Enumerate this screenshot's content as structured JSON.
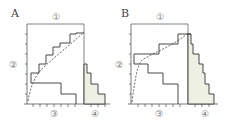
{
  "panels": [
    {
      "label": "A",
      "markers": {
        "top": "①",
        "left": "②",
        "bottom_left": "③",
        "bottom_right": "④"
      }
    },
    {
      "label": "B",
      "markers": {
        "top": "①",
        "left": "②",
        "bottom_left": "③",
        "bottom_right": "④"
      }
    }
  ],
  "colors": {
    "line": "#333333",
    "axis": "#555555",
    "shade": "#eef0e4",
    "dash": "#444444"
  }
}
